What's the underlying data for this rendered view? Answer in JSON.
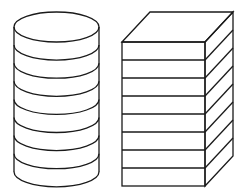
{
  "diagram": {
    "stroke_color": "#1a1a1a",
    "background": "#ffffff",
    "cylinder_stack": {
      "layers": 9,
      "cx": 56.5,
      "rx": 42.5,
      "ry": 15,
      "top_y": 27,
      "bottom_y": 172,
      "spacing": 18.1
    },
    "box_stack": {
      "layers": 8,
      "front_left": 122,
      "front_right": 205,
      "front_top": 42,
      "front_bottom": 186,
      "depth_dx": 28,
      "depth_dy": -30
    }
  }
}
